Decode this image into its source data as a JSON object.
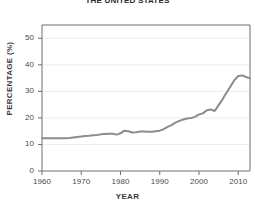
{
  "chart_data": {
    "type": "line",
    "title": "THE UNITED STATES",
    "subtitle": "",
    "xlabel": "YEAR",
    "ylabel": "PERCENTAGE (%)",
    "xlim": [
      1960,
      2013
    ],
    "ylim": [
      0,
      55
    ],
    "xticks": [
      1960,
      1970,
      1980,
      1990,
      2000,
      2010
    ],
    "xtick_labels": [
      "1960",
      "1970",
      "1980",
      "1990",
      "2000",
      "2010"
    ],
    "yticks": [
      0,
      10,
      20,
      30,
      40,
      50
    ],
    "ytick_labels": [
      "0",
      "10",
      "20",
      "30",
      "40",
      "50"
    ],
    "grid": "horizontal",
    "legend": "none",
    "line_color": "#8c8c8c",
    "line_width": 2,
    "x": [
      1960,
      1961,
      1962,
      1963,
      1964,
      1965,
      1966,
      1967,
      1968,
      1969,
      1970,
      1971,
      1972,
      1973,
      1974,
      1975,
      1976,
      1977,
      1978,
      1979,
      1980,
      1981,
      1982,
      1983,
      1984,
      1985,
      1986,
      1987,
      1988,
      1989,
      1990,
      1991,
      1992,
      1993,
      1994,
      1995,
      1996,
      1997,
      1998,
      1999,
      2000,
      2001,
      2002,
      2003,
      2004,
      2005,
      2006,
      2007,
      2008,
      2009,
      2010,
      2011,
      2012,
      2013
    ],
    "y": [
      12.3,
      12.3,
      12.3,
      12.3,
      12.3,
      12.3,
      12.3,
      12.4,
      12.6,
      12.8,
      13.0,
      13.2,
      13.3,
      13.5,
      13.6,
      13.8,
      13.9,
      14.0,
      14.0,
      13.7,
      14.2,
      15.2,
      15.0,
      14.5,
      14.6,
      14.9,
      14.9,
      14.8,
      14.8,
      15.0,
      15.2,
      15.8,
      16.6,
      17.3,
      18.2,
      18.9,
      19.4,
      19.8,
      20.0,
      20.4,
      21.3,
      21.7,
      22.9,
      23.2,
      22.6,
      24.8,
      27.0,
      29.5,
      31.8,
      34.2,
      35.8,
      36.0,
      35.4,
      34.9
    ]
  },
  "meta": {
    "chart_name": "percentage-over-time-line-chart"
  }
}
